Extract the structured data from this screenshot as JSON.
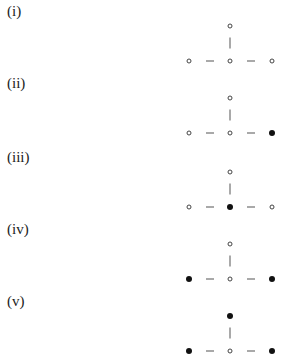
{
  "panels": [
    {
      "label": "(i)",
      "top": 0,
      "nodes": {
        "top": "open",
        "left": "open",
        "center": "open",
        "right": "open"
      }
    },
    {
      "label": "(ii)",
      "top": 72,
      "nodes": {
        "top": "open",
        "left": "open",
        "center": "open",
        "right": "filled"
      }
    },
    {
      "label": "(iii)",
      "top": 146,
      "nodes": {
        "top": "open",
        "left": "open",
        "center": "filled",
        "right": "open"
      }
    },
    {
      "label": "(iv)",
      "top": 218,
      "nodes": {
        "top": "open",
        "left": "filled",
        "center": "open",
        "right": "filled"
      }
    },
    {
      "label": "(v)",
      "top": 290,
      "nodes": {
        "top": "filled",
        "left": "filled",
        "center": "open",
        "right": "filled"
      }
    }
  ],
  "legend": {
    "open": "open circle (○)",
    "filled": "filled circle (●)"
  }
}
